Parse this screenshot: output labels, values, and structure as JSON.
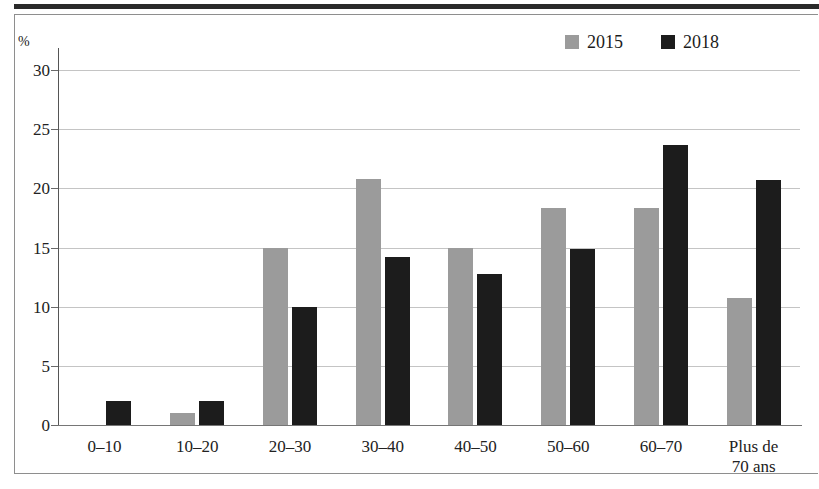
{
  "chart_data": {
    "type": "bar",
    "title": "",
    "xlabel": "",
    "ylabel": "%",
    "ylim": [
      0,
      30
    ],
    "yticks": [
      0,
      5,
      10,
      15,
      20,
      25,
      30
    ],
    "ytick_labels": [
      "0",
      "5",
      "10",
      "15",
      "20",
      "25",
      "30"
    ],
    "grid": true,
    "legend_position": "top-right",
    "categories": [
      "0–10",
      "10–20",
      "20–30",
      "30–40",
      "40–50",
      "50–60",
      "60–70",
      "Plus de\n70 ans"
    ],
    "series": [
      {
        "name": "2015",
        "color": "#9b9b9b",
        "values": [
          0,
          1.0,
          15.0,
          20.8,
          15.0,
          18.3,
          18.3,
          10.7
        ]
      },
      {
        "name": "2018",
        "color": "#1c1c1c",
        "values": [
          2.0,
          2.0,
          10.0,
          14.2,
          12.8,
          14.9,
          23.7,
          20.7
        ]
      }
    ]
  },
  "legend": {
    "items": [
      {
        "label": "2015",
        "color": "#9b9b9b"
      },
      {
        "label": "2018",
        "color": "#1c1c1c"
      }
    ]
  },
  "axis": {
    "unit": "%"
  }
}
